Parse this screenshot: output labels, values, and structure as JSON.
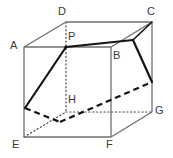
{
  "figure": {
    "type": "geometry-diagram",
    "shape": "cube",
    "canvas": {
      "width": 173,
      "height": 158
    },
    "colors": {
      "background": "#ffffff",
      "edge_visible": "#6e6e6e",
      "edge_hidden": "#4a4a4a",
      "cut_solid": "#141414",
      "cut_hidden": "#141414",
      "label_text": "#3a3a3a"
    },
    "vertices": [
      {
        "name": "A",
        "x": 24,
        "y": 47,
        "label_x": 10,
        "label_y": 40
      },
      {
        "name": "B",
        "x": 111,
        "y": 47,
        "label_x": 113,
        "label_y": 50
      },
      {
        "name": "C",
        "x": 152,
        "y": 22,
        "label_x": 147,
        "label_y": 6
      },
      {
        "name": "D",
        "x": 66,
        "y": 22,
        "label_x": 58,
        "label_y": 6
      },
      {
        "name": "E",
        "x": 24,
        "y": 137,
        "label_x": 12,
        "label_y": 139
      },
      {
        "name": "F",
        "x": 111,
        "y": 137,
        "label_x": 106,
        "label_y": 139
      },
      {
        "name": "G",
        "x": 152,
        "y": 112,
        "label_x": 155,
        "label_y": 105
      },
      {
        "name": "H",
        "x": 66,
        "y": 112,
        "label_x": 68,
        "label_y": 94
      }
    ],
    "points": [
      {
        "name": "P",
        "x": 66,
        "y": 47,
        "label_x": 68,
        "label_y": 31,
        "on_edge": "AB"
      }
    ],
    "edges_visible": [
      {
        "name": "AB",
        "from": "A",
        "to": "B"
      },
      {
        "name": "AD",
        "from": "A",
        "to": "D"
      },
      {
        "name": "DC",
        "from": "D",
        "to": "C"
      },
      {
        "name": "BC",
        "from": "B",
        "to": "C"
      },
      {
        "name": "AE",
        "from": "A",
        "to": "E"
      },
      {
        "name": "BF",
        "from": "B",
        "to": "F"
      },
      {
        "name": "CG",
        "from": "C",
        "to": "G"
      },
      {
        "name": "EF",
        "from": "E",
        "to": "F"
      },
      {
        "name": "FG",
        "from": "F",
        "to": "G"
      }
    ],
    "edges_hidden": [
      {
        "name": "DH",
        "from": "D",
        "to": "H"
      },
      {
        "name": "EH",
        "from": "E",
        "to": "H"
      },
      {
        "name": "HG",
        "from": "H",
        "to": "G"
      }
    ],
    "cut_section": {
      "name": "cutting-plane-section",
      "solid_segments": [
        {
          "name": "P-to-Q",
          "x1": 66,
          "y1": 47,
          "x2": 25,
          "y2": 108
        },
        {
          "name": "P-to-S",
          "x1": 66,
          "y1": 47,
          "x2": 133,
          "y2": 40
        },
        {
          "name": "S-to-C",
          "x1": 133,
          "y1": 40,
          "x2": 152,
          "y2": 22
        },
        {
          "name": "S-to-T",
          "x1": 133,
          "y1": 40,
          "x2": 152,
          "y2": 82
        }
      ],
      "hidden_segments": [
        {
          "name": "Q-to-R",
          "x1": 25,
          "y1": 108,
          "x2": 60,
          "y2": 122
        },
        {
          "name": "R-to-T",
          "x1": 60,
          "y1": 122,
          "x2": 152,
          "y2": 82
        }
      ]
    }
  },
  "labels": {
    "A": "A",
    "B": "B",
    "C": "C",
    "D": "D",
    "E": "E",
    "F": "F",
    "G": "G",
    "H": "H",
    "P": "P"
  }
}
